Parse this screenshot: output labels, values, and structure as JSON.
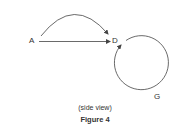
{
  "figure": {
    "labels": {
      "a": "A",
      "d": "D",
      "g": "G"
    },
    "subtitle": "(side view)",
    "caption": "Figure 4",
    "colors": {
      "stroke": "#444444",
      "text": "#333333"
    }
  }
}
